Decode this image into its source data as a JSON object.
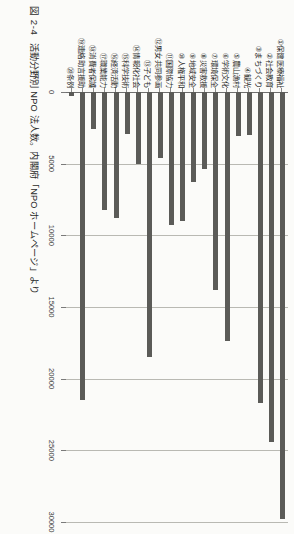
{
  "figure": {
    "number": "図 2-4",
    "caption": "活動分野別 NPO 法人数。内閣府「NPO ホームページ」より"
  },
  "chart_data": {
    "type": "bar",
    "orientation": "horizontal",
    "title": "活動分野別 NPO 法人数",
    "xlabel": "",
    "ylabel": "",
    "xlim": [
      0,
      30000
    ],
    "grid": true,
    "legend": "none",
    "bar_color": "#5b5b58",
    "ticks": [
      0,
      5000,
      10000,
      15000,
      20000,
      25000,
      30000
    ],
    "tick_labels": [
      "0",
      "5000",
      "10000",
      "15000",
      "20000",
      "25000",
      "30000"
    ],
    "categories": [
      "①保健医療福祉",
      "②社会教育",
      "③まちづくり",
      "④観光",
      "⑤農山漁村",
      "⑥学術文化",
      "⑦環境保全",
      "⑧災害救援",
      "⑨地域安全",
      "⑩人権平和",
      "⑪国際協力",
      "⑫男女共同参画",
      "⑬子ども",
      "⑭情報化社会",
      "⑮科学技術",
      "⑯経済活動",
      "⑰職業能力",
      "⑱消費者保護",
      "⑲連絡助言援助",
      "⑳条例"
    ],
    "values": [
      29800,
      24400,
      21700,
      3000,
      3100,
      17400,
      13800,
      5400,
      6300,
      9000,
      9300,
      4600,
      18500,
      5000,
      2900,
      8800,
      8200,
      2600,
      21500,
      300
    ]
  }
}
